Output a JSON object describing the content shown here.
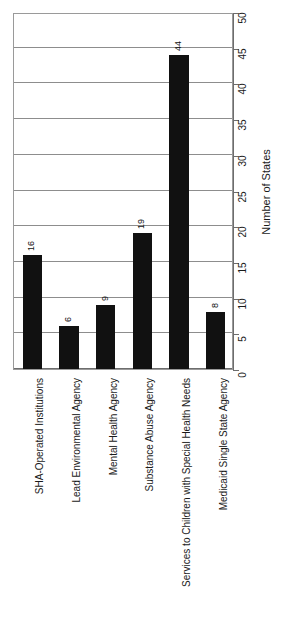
{
  "chart_data": {
    "type": "bar",
    "title": "",
    "subtitle": "",
    "xlabel": "",
    "ylabel": "Number of States",
    "ylim": [
      0,
      50
    ],
    "ytick_step": 5,
    "yticks": [
      0,
      5,
      10,
      15,
      20,
      25,
      30,
      35,
      40,
      45,
      50
    ],
    "grid": true,
    "legend": null,
    "orientation": "rotated-90",
    "bar_color": "#111111",
    "categories": [
      "SHA-Operated Institutions",
      "Lead Environmental Agency",
      "Mental Health Agency",
      "Substance Abuse Agency",
      "Services to Children with Special Health Needs",
      "Medicaid Single State Agency"
    ],
    "values": [
      16,
      6,
      9,
      19,
      44,
      8
    ],
    "data_labels": [
      "16",
      "6",
      "9",
      "19",
      "44",
      "8"
    ]
  },
  "axis": {
    "value_axis_title": "Number of States",
    "tick_labels": [
      "0",
      "5",
      "10",
      "15",
      "20",
      "25",
      "30",
      "35",
      "40",
      "45",
      "50"
    ]
  }
}
